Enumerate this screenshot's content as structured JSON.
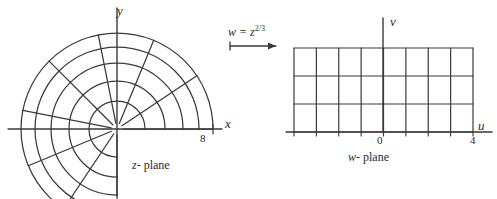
{
  "figure": {
    "type": "conformal-mapping-diagram",
    "background": "#ffffff",
    "ink": "#3a3a3a"
  },
  "mapping": {
    "label_base": "w = z",
    "label_exponent": "2/3",
    "arrow": "right-arrow"
  },
  "left_panel": {
    "name": "z-plane",
    "caption_var": "z",
    "caption_word": "- plane",
    "axis_x_label": "x",
    "axis_y_label": "y",
    "tick_label": "8",
    "origin": {
      "x": 117,
      "y": 129
    },
    "grid": {
      "kind": "polar",
      "radii": [
        28,
        48,
        66,
        82,
        96
      ],
      "rays_deg": [
        0,
        33.75,
        67.5,
        101.25,
        135,
        168.75,
        202.5,
        236.25,
        270
      ],
      "angle_start_deg": 0,
      "angle_end_deg": 270,
      "radius_outer": 96,
      "tick_x_radius": 96
    }
  },
  "right_panel": {
    "name": "w-plane",
    "caption_var": "w",
    "caption_word": "- plane",
    "axis_u_label": "u",
    "axis_v_label": "v",
    "tick_labels": [
      "0",
      "4"
    ],
    "origin": {
      "x": 383,
      "y": 132
    },
    "grid": {
      "kind": "rectangular",
      "columns": 8,
      "rows": 3,
      "left": 294,
      "right": 473,
      "top": 48,
      "bottom": 132,
      "u_min": -4,
      "u_max": 4,
      "v_min": 0,
      "v_max": 3
    }
  },
  "chart_data": {
    "type": "diagram",
    "panels": [
      {
        "label": "z- plane",
        "axes": [
          "x",
          "y"
        ],
        "marks": [
          "8"
        ],
        "description": "polar grid of circular arcs and radial rays covering 270 degrees from positive x-axis counterclockwise to negative y-axis"
      },
      {
        "label": "w- plane",
        "axes": [
          "u",
          "v"
        ],
        "marks": [
          "0",
          "4"
        ],
        "description": "rectangular grid 8 columns by 3 rows spanning u from -4 to 4 and v from 0 to 3"
      }
    ]
  }
}
